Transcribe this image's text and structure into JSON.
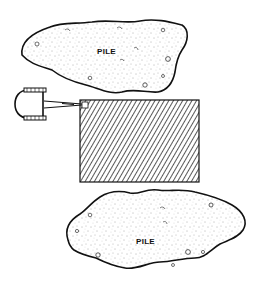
{
  "diagram": {
    "type": "site layout line drawing",
    "colors": {
      "ink": "#111111",
      "background": "#ffffff",
      "fill_speckle": "#555555"
    },
    "piles": [
      {
        "id": "top-pile",
        "label": "PILE"
      },
      {
        "id": "bottom-pile",
        "label": "PILE"
      }
    ],
    "work_area": {
      "id": "hatched-area",
      "pattern": "diagonal-hatch"
    },
    "machine": {
      "id": "loader",
      "description": "machine with cable/boom extending to work area corner"
    }
  }
}
